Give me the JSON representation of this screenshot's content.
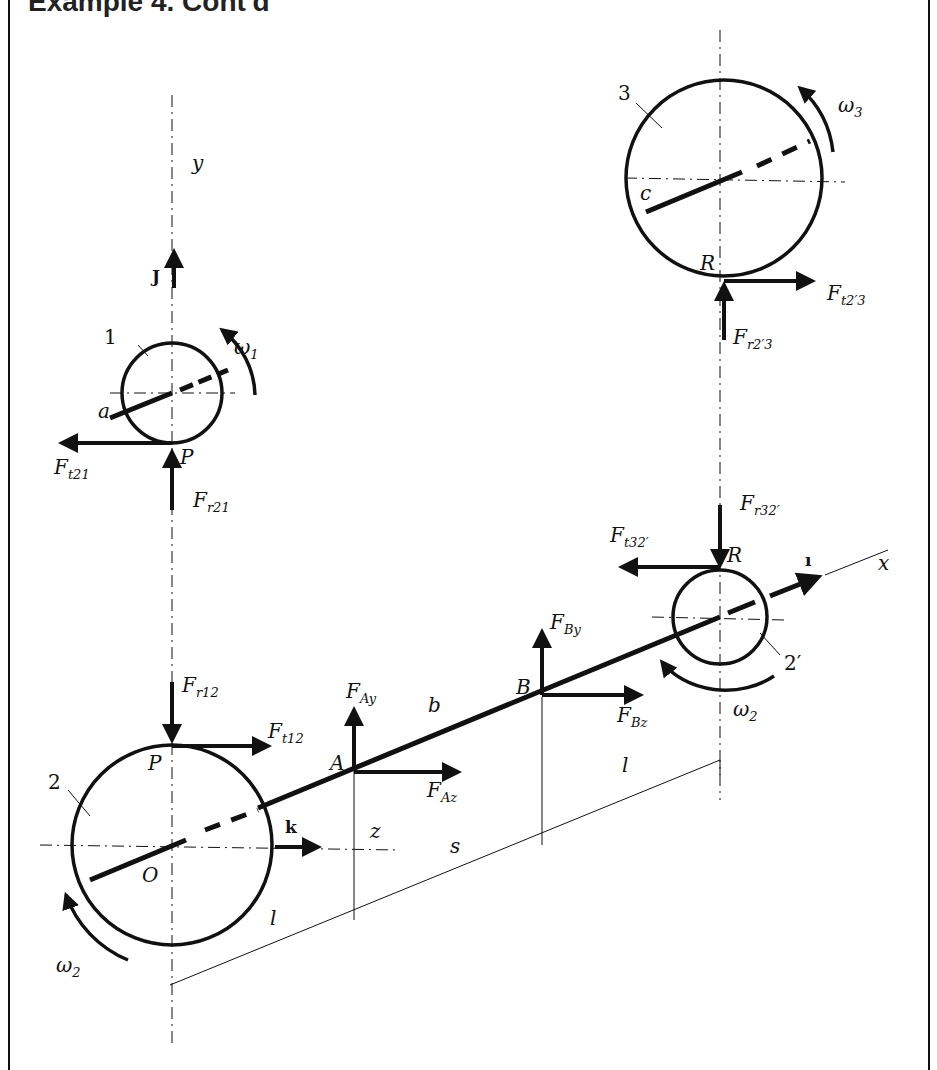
{
  "title": "Example 4. Cont'd",
  "axes": {
    "x": "x",
    "y": "y",
    "z": "z",
    "s": "s"
  },
  "unit_vectors": {
    "i": "ı",
    "j": "J",
    "k": "k"
  },
  "gears": [
    {
      "id": "1",
      "label": "1",
      "center_label": "a",
      "contact": "P",
      "omega": "ω",
      "omega_sub": "1"
    },
    {
      "id": "2",
      "label": "2",
      "center_label": "O",
      "contact": "P",
      "omega": "ω",
      "omega_sub": "2"
    },
    {
      "id": "2prime",
      "label": "2′",
      "contact": "R",
      "omega": "ω",
      "omega_sub": "2"
    },
    {
      "id": "3",
      "label": "3",
      "center_label": "c",
      "contact": "R",
      "omega": "ω",
      "omega_sub": "3"
    }
  ],
  "bearings": [
    {
      "id": "A",
      "label": "A",
      "forces": [
        {
          "F": "F",
          "sub": "Ay"
        },
        {
          "F": "F",
          "sub": "Az"
        }
      ]
    },
    {
      "id": "B",
      "label": "B",
      "forces": [
        {
          "F": "F",
          "sub": "By"
        },
        {
          "F": "F",
          "sub": "Bz"
        }
      ]
    }
  ],
  "forces": {
    "ft21": {
      "F": "F",
      "sub": "t21"
    },
    "fr21": {
      "F": "F",
      "sub": "r21"
    },
    "fr12": {
      "F": "F",
      "sub": "r12"
    },
    "ft12": {
      "F": "F",
      "sub": "t12"
    },
    "ft23": {
      "F": "F",
      "sub": "t2′3"
    },
    "fr23": {
      "F": "F",
      "sub": "r2′3"
    },
    "fr32": {
      "F": "F",
      "sub": "r32′"
    },
    "ft32": {
      "F": "F",
      "sub": "t32′"
    }
  },
  "dimensions": {
    "b": "b",
    "l_left": "l",
    "l_right": "l"
  }
}
